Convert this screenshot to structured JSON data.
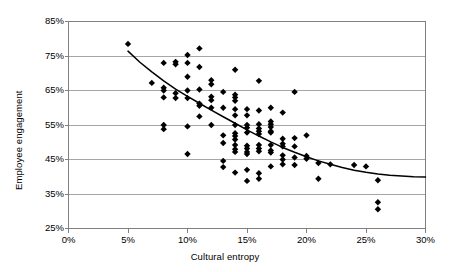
{
  "chart_data": {
    "type": "scatter",
    "title": "",
    "xlabel": "Cultural entropy",
    "ylabel": "Employee engagement",
    "xlim": [
      0,
      30
    ],
    "ylim": [
      25,
      85
    ],
    "xticks": [
      "0%",
      "5%",
      "10%",
      "15%",
      "20%",
      "25%",
      "30%"
    ],
    "xtick_values": [
      0,
      5,
      10,
      15,
      20,
      25,
      30
    ],
    "yticks": [
      "25%",
      "35%",
      "45%",
      "55%",
      "65%",
      "75%",
      "85%"
    ],
    "ytick_values": [
      25,
      35,
      45,
      55,
      65,
      75,
      85
    ],
    "grid": "horizontal",
    "legend": "none",
    "marker": "diamond",
    "marker_color": "#000000",
    "marker_size": 3.2,
    "gridline_color": "#a6a6a6",
    "axis_color": "#808080",
    "trendline_color": "#000000",
    "trendline_label": "power trend",
    "points": [
      [
        5.0,
        78.5
      ],
      [
        7.0,
        67.2
      ],
      [
        8.0,
        73.0
      ],
      [
        8.0,
        65.8
      ],
      [
        8.0,
        65.0
      ],
      [
        8.0,
        63.0
      ],
      [
        8.0,
        55.0
      ],
      [
        8.0,
        53.8
      ],
      [
        9.0,
        73.3
      ],
      [
        9.0,
        72.6
      ],
      [
        9.0,
        64.2
      ],
      [
        9.0,
        62.8
      ],
      [
        10.0,
        75.3
      ],
      [
        10.0,
        73.0
      ],
      [
        10.0,
        69.0
      ],
      [
        10.0,
        65.0
      ],
      [
        10.0,
        62.8
      ],
      [
        10.0,
        54.6
      ],
      [
        10.0,
        46.6
      ],
      [
        11.0,
        77.2
      ],
      [
        11.0,
        71.8
      ],
      [
        11.0,
        65.3
      ],
      [
        11.0,
        61.2
      ],
      [
        11.0,
        60.6
      ],
      [
        11.0,
        57.5
      ],
      [
        12.0,
        68.0
      ],
      [
        12.0,
        66.8
      ],
      [
        12.0,
        63.2
      ],
      [
        12.0,
        62.2
      ],
      [
        12.0,
        60.0
      ],
      [
        12.0,
        55.0
      ],
      [
        13.0,
        64.6
      ],
      [
        13.0,
        60.0
      ],
      [
        13.0,
        52.0
      ],
      [
        13.0,
        49.8
      ],
      [
        13.0,
        44.6
      ],
      [
        13.0,
        42.8
      ],
      [
        14.0,
        71.0
      ],
      [
        14.0,
        63.8
      ],
      [
        14.0,
        63.0
      ],
      [
        14.0,
        62.0
      ],
      [
        14.0,
        59.6
      ],
      [
        14.0,
        57.8
      ],
      [
        14.0,
        55.0
      ],
      [
        14.0,
        52.6
      ],
      [
        14.0,
        51.8
      ],
      [
        14.0,
        50.8
      ],
      [
        14.0,
        49.2
      ],
      [
        14.0,
        48.0
      ],
      [
        14.0,
        47.2
      ],
      [
        14.0,
        41.2
      ],
      [
        15.0,
        59.6
      ],
      [
        15.0,
        57.8
      ],
      [
        15.0,
        55.0
      ],
      [
        15.0,
        54.2
      ],
      [
        15.0,
        52.8
      ],
      [
        15.0,
        49.0
      ],
      [
        15.0,
        48.2
      ],
      [
        15.0,
        47.2
      ],
      [
        15.0,
        46.6
      ],
      [
        15.0,
        42.0
      ],
      [
        15.0,
        38.8
      ],
      [
        16.0,
        67.8
      ],
      [
        16.0,
        59.2
      ],
      [
        16.0,
        55.2
      ],
      [
        16.0,
        54.0
      ],
      [
        16.0,
        53.2
      ],
      [
        16.0,
        52.4
      ],
      [
        16.0,
        49.2
      ],
      [
        16.0,
        48.2
      ],
      [
        16.0,
        47.4
      ],
      [
        16.0,
        41.0
      ],
      [
        16.0,
        39.4
      ],
      [
        17.0,
        60.0
      ],
      [
        17.0,
        56.0
      ],
      [
        17.0,
        55.2
      ],
      [
        17.0,
        54.4
      ],
      [
        17.0,
        53.2
      ],
      [
        17.0,
        52.8
      ],
      [
        17.0,
        49.2
      ],
      [
        17.0,
        47.6
      ],
      [
        17.0,
        47.0
      ],
      [
        17.0,
        43.0
      ],
      [
        18.0,
        58.6
      ],
      [
        18.0,
        51.0
      ],
      [
        18.0,
        49.6
      ],
      [
        18.0,
        48.8
      ],
      [
        18.0,
        46.2
      ],
      [
        18.0,
        45.0
      ],
      [
        18.0,
        43.6
      ],
      [
        19.0,
        64.6
      ],
      [
        19.0,
        51.2
      ],
      [
        19.0,
        48.8
      ],
      [
        19.0,
        45.6
      ],
      [
        19.0,
        43.4
      ],
      [
        20.0,
        52.0
      ],
      [
        20.0,
        46.0
      ],
      [
        20.0,
        45.2
      ],
      [
        21.0,
        44.0
      ],
      [
        21.0,
        39.4
      ],
      [
        22.0,
        43.6
      ],
      [
        24.0,
        43.4
      ],
      [
        25.0,
        43.0
      ],
      [
        26.0,
        39.0
      ],
      [
        26.0,
        32.6
      ],
      [
        26.0,
        30.6
      ]
    ],
    "trendline": [
      [
        5.0,
        76.4
      ],
      [
        6.0,
        73.2
      ],
      [
        7.0,
        70.4
      ],
      [
        8.0,
        67.8
      ],
      [
        9.0,
        65.4
      ],
      [
        10.0,
        63.3
      ],
      [
        11.0,
        61.3
      ],
      [
        12.0,
        59.3
      ],
      [
        13.0,
        57.4
      ],
      [
        14.0,
        55.5
      ],
      [
        15.0,
        53.6
      ],
      [
        16.0,
        51.8
      ],
      [
        17.0,
        50.1
      ],
      [
        18.0,
        48.5
      ],
      [
        19.0,
        47.1
      ],
      [
        20.0,
        45.8
      ],
      [
        21.0,
        44.6
      ],
      [
        22.0,
        43.6
      ],
      [
        23.0,
        42.7
      ],
      [
        24.0,
        41.9
      ],
      [
        25.0,
        41.3
      ],
      [
        26.0,
        40.8
      ],
      [
        27.0,
        40.4
      ],
      [
        28.0,
        40.2
      ],
      [
        29.0,
        40.0
      ],
      [
        30.0,
        39.9
      ]
    ]
  }
}
